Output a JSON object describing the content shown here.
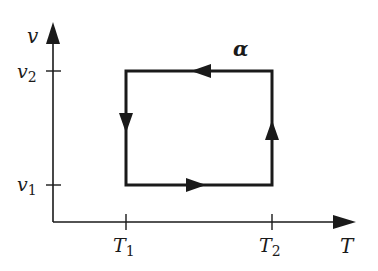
{
  "diagram": {
    "type": "thermodynamic-cycle",
    "colors": {
      "ink": "#1a1a1a",
      "background": "#ffffff"
    },
    "axes": {
      "x": {
        "label": "T",
        "ticks": [
          {
            "main": "T",
            "sub": "1"
          },
          {
            "main": "T",
            "sub": "2"
          }
        ]
      },
      "y": {
        "label": "v",
        "ticks": [
          {
            "main": "v",
            "sub": "2"
          },
          {
            "main": "v",
            "sub": "1"
          }
        ]
      }
    },
    "cycle": {
      "label": "α",
      "vertices": [
        "(T1, v1)",
        "(T2, v1)",
        "(T2, v2)",
        "(T1, v2)"
      ],
      "direction": "counterclockwise",
      "segments": [
        {
          "from": "(T1, v1)",
          "to": "(T2, v1)",
          "arrow": "right"
        },
        {
          "from": "(T2, v1)",
          "to": "(T2, v2)",
          "arrow": "up"
        },
        {
          "from": "(T2, v2)",
          "to": "(T1, v2)",
          "arrow": "left"
        },
        {
          "from": "(T1, v2)",
          "to": "(T1, v1)",
          "arrow": "down"
        }
      ]
    }
  }
}
